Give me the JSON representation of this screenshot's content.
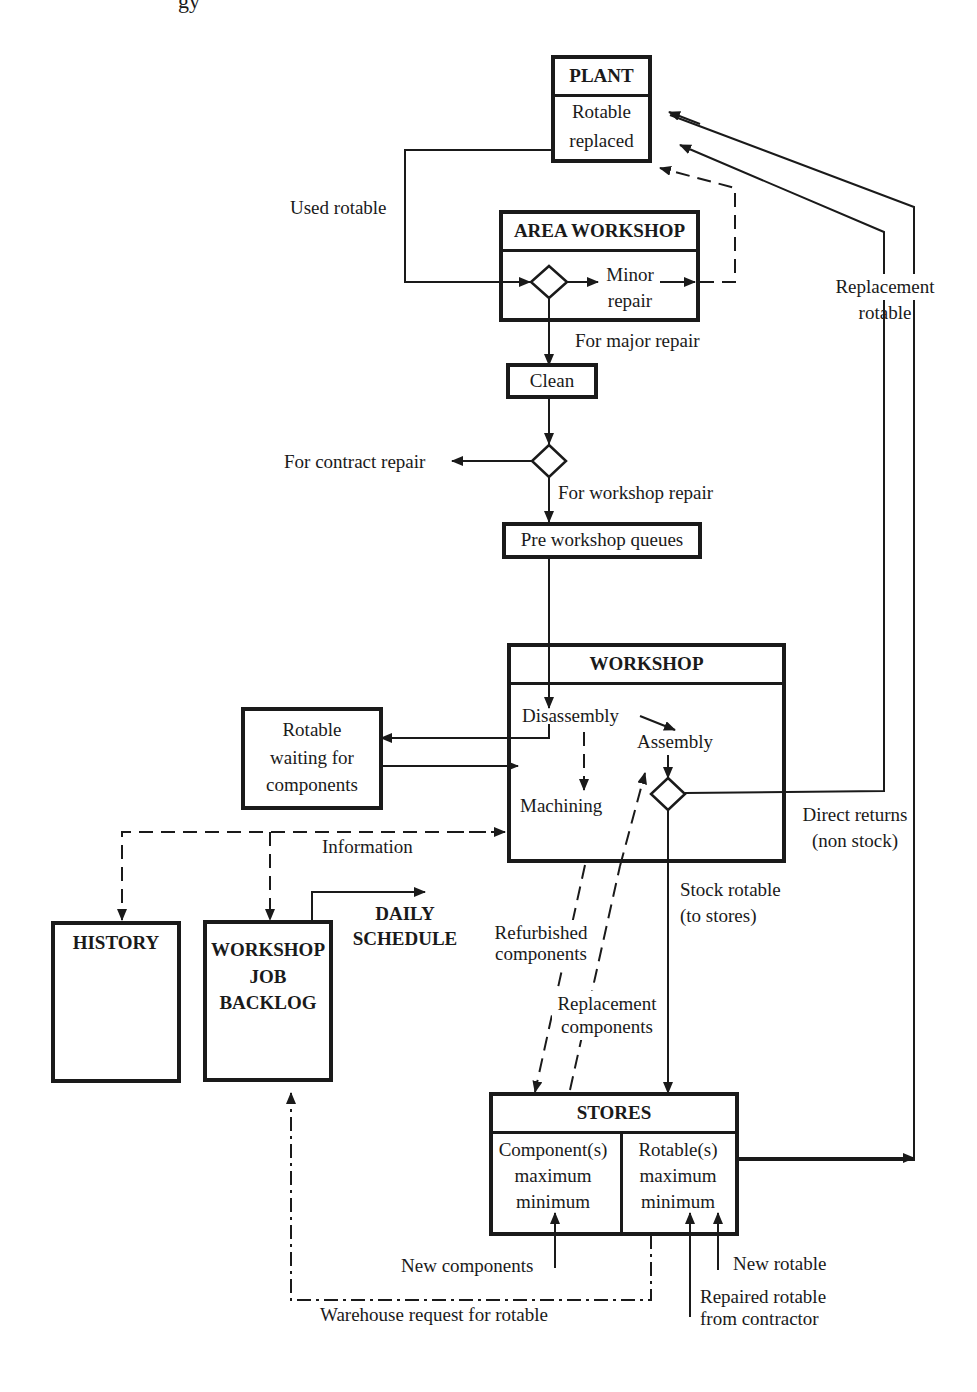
{
  "running_header": "gy",
  "nodes": {
    "plant": {
      "title": "PLANT",
      "body": [
        "Rotable",
        "replaced"
      ]
    },
    "area_workshop": {
      "title": "AREA WORKSHOP",
      "minor_repair": [
        "Minor",
        "repair"
      ]
    },
    "clean": {
      "label": "Clean"
    },
    "pre_workshop_queues": {
      "label": "Pre workshop queues"
    },
    "workshop": {
      "title": "WORKSHOP",
      "disassembly": "Disassembly",
      "assembly": "Assembly",
      "machining": "Machining"
    },
    "rotable_waiting": {
      "lines": [
        "Rotable",
        "waiting for",
        "components"
      ]
    },
    "history": {
      "title": "HISTORY"
    },
    "job_backlog": {
      "lines": [
        "WORKSHOP",
        "JOB",
        "BACKLOG"
      ]
    },
    "daily_schedule": {
      "lines": [
        "DAILY",
        "SCHEDULE"
      ]
    },
    "stores": {
      "title": "STORES",
      "components": [
        "Component(s)",
        "maximum",
        "minimum"
      ],
      "rotables": [
        "Rotable(s)",
        "maximum",
        "minimum"
      ]
    }
  },
  "edge_labels": {
    "used_rotable": "Used rotable",
    "for_major_repair": "For major repair",
    "for_contract_repair": "For contract repair",
    "for_workshop_repair": "For workshop repair",
    "replacement_rotable": [
      "Replacement",
      "rotable"
    ],
    "information": "Information",
    "direct_returns": [
      "Direct returns",
      "(non stock)"
    ],
    "stock_rotable": [
      "Stock rotable",
      "(to stores)"
    ],
    "refurbished_components": [
      "Refurbished",
      "components"
    ],
    "replacement_components": [
      "Replacement",
      "components"
    ],
    "new_components": "New components",
    "new_rotable": "New rotable",
    "repaired_rotable": [
      "Repaired rotable",
      "from contractor"
    ],
    "warehouse_request": "Warehouse request for rotable"
  },
  "legend_line_styles": {
    "solid": "material flow",
    "dashed": "information / component flow",
    "dash_dot": "warehouse request"
  },
  "colors": {
    "ink": "#1a1a1a",
    "background": "#ffffff"
  }
}
